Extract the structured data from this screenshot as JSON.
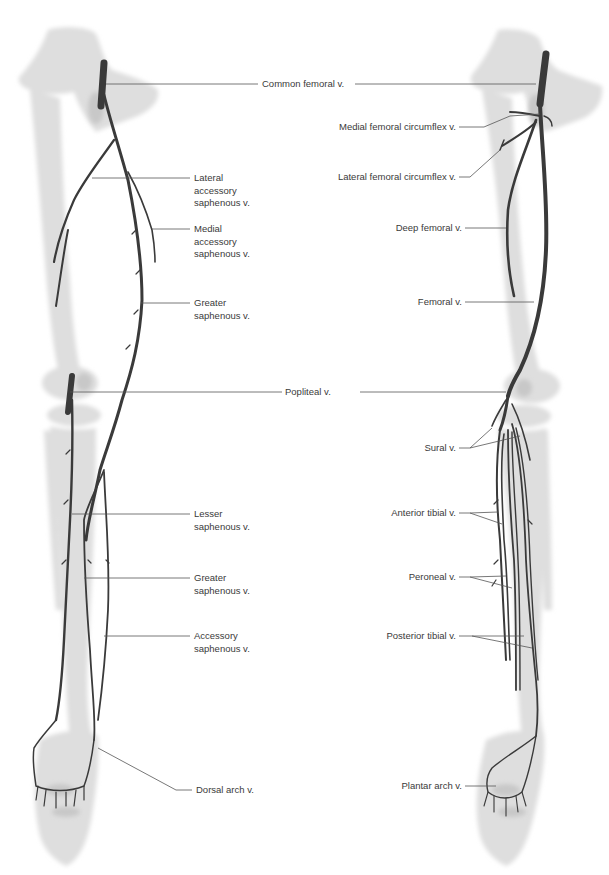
{
  "figure": {
    "left_view": "anterior-superficial veins of lower limb",
    "right_view": "deep veins of lower limb",
    "colors": {
      "vein": "#3a3a3a",
      "bone": "#dcdcdc",
      "bone_shadow": "#c4c4c4",
      "leader_line": "#555555",
      "text": "#3a3a3a",
      "background": "#ffffff"
    }
  },
  "labels": {
    "common_femoral": "Common femoral v.",
    "popliteal": "Popliteal v.",
    "left": {
      "lateral_accessory_saphenous": "Lateral\naccessory\nsaphenous v.",
      "medial_accessory_saphenous": "Medial\naccessory\nsaphenous v.",
      "greater_saphenous_thigh": "Greater\nsaphenous v.",
      "lesser_saphenous": "Lesser\nsaphenous v.",
      "greater_saphenous_leg": "Greater\nsaphenous v.",
      "accessory_saphenous": "Accessory\nsaphenous v.",
      "dorsal_arch": "Dorsal arch v."
    },
    "right": {
      "medial_femoral_circumflex": "Medial femoral circumflex v.",
      "lateral_femoral_circumflex": "Lateral femoral circumflex v.",
      "deep_femoral": "Deep femoral v.",
      "femoral": "Femoral v.",
      "sural": "Sural v.",
      "anterior_tibial": "Anterior tibial v.",
      "peroneal": "Peroneal v.",
      "posterior_tibial": "Posterior tibial v.",
      "plantar_arch": "Plantar arch v."
    }
  }
}
